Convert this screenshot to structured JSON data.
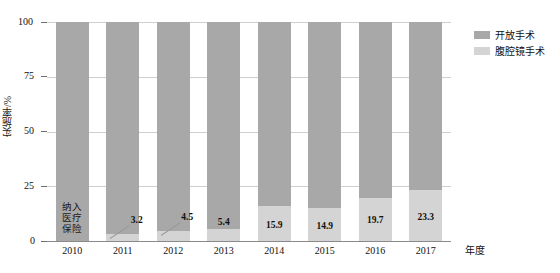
{
  "chart_data": {
    "type": "bar",
    "subtype": "stacked-100-percent",
    "title": "",
    "xlabel": "年度",
    "ylabel": "实施率/%",
    "ylim": [
      0,
      100
    ],
    "yticks": [
      0,
      25,
      50,
      75,
      100
    ],
    "ytick_labels": [
      "0",
      "25",
      "50",
      "75",
      "100"
    ],
    "grid": true,
    "legend_position": "top-right",
    "categories": [
      "2010",
      "2011",
      "2012",
      "2013",
      "2014",
      "2015",
      "2016",
      "2017"
    ],
    "series": [
      {
        "name": "开放手术",
        "color": "#a8a8a8",
        "values": [
          100,
          96.8,
          95.5,
          94.6,
          84.1,
          85.1,
          80.3,
          76.7
        ]
      },
      {
        "name": "腹腔镜手术",
        "color": "#d4d4d4",
        "values": [
          0,
          3.2,
          4.5,
          5.4,
          15.9,
          14.9,
          19.7,
          23.3
        ]
      }
    ],
    "data_labels": [
      {
        "category": "2011",
        "value": "3.2",
        "leader": true
      },
      {
        "category": "2012",
        "value": "4.5",
        "leader": true
      },
      {
        "category": "2013",
        "value": "5.4",
        "leader": false
      },
      {
        "category": "2014",
        "value": "15.9",
        "leader": false
      },
      {
        "category": "2015",
        "value": "14.9",
        "leader": false
      },
      {
        "category": "2016",
        "value": "19.7",
        "leader": false
      },
      {
        "category": "2017",
        "value": "23.3",
        "leader": false
      }
    ],
    "annotations": [
      {
        "category": "2010",
        "text": "纳入医疗保险",
        "lines": [
          "纳入",
          "医疗",
          "保险"
        ]
      }
    ]
  },
  "legend": {
    "items": [
      {
        "label": "开放手术",
        "color": "#a8a8a8"
      },
      {
        "label": "腹腔镜手术",
        "color": "#d4d4d4"
      }
    ]
  },
  "axes": {
    "y_title": "实施率/%",
    "x_title": "年度",
    "y_ticks": [
      "100",
      "75",
      "50",
      "25",
      "0"
    ],
    "x_ticks": [
      "2010",
      "2011",
      "2012",
      "2013",
      "2014",
      "2015",
      "2016",
      "2017"
    ]
  }
}
